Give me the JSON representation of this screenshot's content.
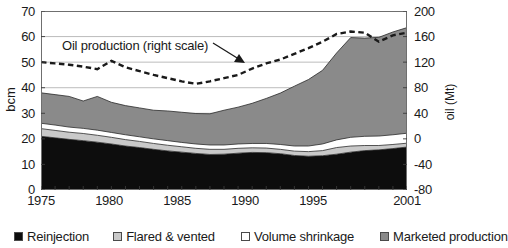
{
  "axes": {
    "left_title": "bcm",
    "right_title": "oil (Mt)",
    "left_ticks": [
      "70",
      "60",
      "50",
      "40",
      "30",
      "20",
      "10",
      "0"
    ],
    "right_ticks": [
      "200",
      "160",
      "120",
      "80",
      "40",
      "0",
      "-40",
      "-80"
    ],
    "x_ticks": [
      "1975",
      "1980",
      "1985",
      "1990",
      "1995",
      "2001"
    ]
  },
  "annotation": {
    "text": "Oil production (right scale)"
  },
  "legend": {
    "items": [
      {
        "label": "Reinjection",
        "color": "#0d0d0d"
      },
      {
        "label": "Flared & vented",
        "color": "#c9c9c9"
      },
      {
        "label": "Volume shrinkage",
        "color": "#ffffff"
      },
      {
        "label": "Marketed production",
        "color": "#8a8a8a"
      }
    ]
  },
  "chart_data": {
    "type": "area",
    "title": "",
    "xlabel": "",
    "ylabel": "bcm",
    "y2label": "oil (Mt)",
    "ylim": [
      0,
      70
    ],
    "y2lim": [
      -80,
      200
    ],
    "xlim": [
      1975,
      2001
    ],
    "grid": true,
    "legend_position": "bottom",
    "stacked": true,
    "x": [
      1975,
      1976,
      1977,
      1978,
      1979,
      1980,
      1981,
      1982,
      1983,
      1984,
      1985,
      1986,
      1987,
      1988,
      1989,
      1990,
      1991,
      1992,
      1993,
      1994,
      1995,
      1996,
      1997,
      1998,
      1999,
      2000,
      2001
    ],
    "series": [
      {
        "name": "Reinjection",
        "color": "#0d0d0d",
        "unit": "bcm",
        "values": [
          21.0,
          20.4,
          19.8,
          19.3,
          18.7,
          18.0,
          17.2,
          16.6,
          15.9,
          15.3,
          14.8,
          14.3,
          13.9,
          14.0,
          14.4,
          14.7,
          14.6,
          14.2,
          13.5,
          13.2,
          13.4,
          14.0,
          14.8,
          15.4,
          15.7,
          16.2,
          16.8
        ]
      },
      {
        "name": "Flared & vented",
        "color": "#c9c9c9",
        "unit": "bcm",
        "values": [
          3.0,
          2.9,
          2.8,
          2.8,
          2.7,
          2.6,
          2.5,
          2.4,
          2.3,
          2.2,
          2.1,
          2.0,
          2.0,
          1.9,
          1.9,
          1.8,
          1.8,
          1.7,
          1.7,
          1.8,
          2.0,
          2.6,
          2.4,
          2.0,
          1.7,
          1.6,
          1.5
        ]
      },
      {
        "name": "Volume shrinkage",
        "color": "#ffffff",
        "unit": "bcm",
        "values": [
          2.1,
          2.1,
          2.0,
          2.0,
          2.0,
          1.9,
          1.9,
          1.8,
          1.8,
          1.8,
          1.7,
          1.7,
          1.7,
          1.7,
          1.7,
          1.7,
          1.8,
          1.9,
          2.0,
          2.2,
          2.6,
          3.0,
          3.4,
          3.6,
          3.7,
          3.8,
          3.9
        ]
      },
      {
        "name": "Marketed production",
        "color": "#8a8a8a",
        "unit": "bcm",
        "values": [
          11.9,
          11.9,
          12.0,
          10.7,
          13.2,
          11.8,
          11.4,
          11.3,
          11.2,
          11.6,
          11.8,
          11.9,
          12.2,
          13.6,
          14.4,
          15.7,
          17.6,
          20.1,
          23.4,
          26.0,
          28.8,
          34.0,
          39.0,
          38.4,
          38.6,
          40.2,
          41.3
        ]
      }
    ],
    "overlay_line": {
      "name": "Oil production (right scale)",
      "axis": "right",
      "unit": "Mt",
      "style": "dashed",
      "color": "#1a1a1a",
      "values": [
        120,
        118,
        116,
        113,
        109,
        122,
        112,
        106,
        100,
        95,
        90,
        86,
        90,
        95,
        100,
        110,
        118,
        124,
        133,
        142,
        152,
        164,
        168,
        166,
        152,
        162,
        166
      ]
    }
  }
}
